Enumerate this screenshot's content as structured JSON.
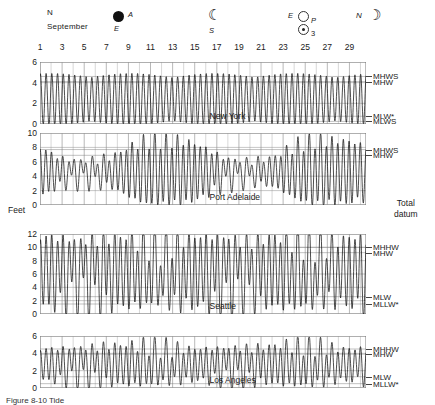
{
  "figure": {
    "caption": "Figure 8-10  Tide",
    "month": "September",
    "y_axis_label": "Feet",
    "right_axis_label_line1": "Total",
    "right_axis_label_line2": "datum"
  },
  "phase_markers": [
    {
      "name": "new-moon-marker",
      "icon": "new-moon-icon",
      "top_label": "N",
      "right_label": "A",
      "bottom_label": "E",
      "x": 47,
      "day": 1
    },
    {
      "name": "first-quarter-marker",
      "icon": "first-quarter-icon",
      "top_label": "",
      "right_label": "",
      "bottom_label": "S",
      "x": 213,
      "day": 16
    },
    {
      "name": "full-moon-marker",
      "icon": "full-moon-icon",
      "top_label": "E",
      "right_label": "P",
      "bottom_label": "",
      "x": 299,
      "day": 23
    },
    {
      "name": "perigee-sun-marker",
      "icon": "sun-icon",
      "top_label": "",
      "right_label": "3",
      "bottom_label": "",
      "x": 299,
      "day": 23
    },
    {
      "name": "last-quarter-marker",
      "icon": "last-quarter-icon",
      "top_label": "N",
      "right_label": "",
      "bottom_label": "",
      "x": 358,
      "day": 28
    }
  ],
  "date_ticks": [
    1,
    3,
    5,
    7,
    9,
    11,
    13,
    15,
    17,
    19,
    21,
    23,
    25,
    27,
    29
  ],
  "chart_data": [
    {
      "type": "line",
      "name": "new-york",
      "title": "New York",
      "xlabel": "September",
      "ylabel": "Feet",
      "ylim": [
        0,
        6
      ],
      "yticks": [
        0,
        2,
        4,
        6
      ],
      "xlim": [
        1,
        30
      ],
      "grid": true,
      "tide_type": "semidiurnal",
      "mean_level": 2.4,
      "amplitude_spring": 2.5,
      "amplitude_neap": 1.7,
      "diurnal_inequality": 0.0,
      "period_hours": 12.42,
      "spring_days": [
        2,
        24
      ],
      "datum_lines": [
        {
          "label": "MHWS",
          "value": 4.6
        },
        {
          "label": "MHW",
          "value": 4.1
        },
        {
          "label": "MLW*",
          "value": 0.75
        },
        {
          "label": "MLWS",
          "value": 0.25
        }
      ]
    },
    {
      "type": "line",
      "name": "port-adelaide",
      "title": "Port Adelaide",
      "xlabel": "September",
      "ylabel": "Feet",
      "ylim": [
        0,
        10
      ],
      "yticks": [
        0,
        2,
        4,
        6,
        8,
        10
      ],
      "xlim": [
        1,
        30
      ],
      "grid": true,
      "tide_type": "mixed-dodge",
      "mean_level": 4.6,
      "amplitude_spring": 3.6,
      "amplitude_neap": 1.1,
      "diurnal_inequality": 1.3,
      "period_hours": 12.42,
      "spring_days": [
        14,
        26
      ],
      "datum_lines": [
        {
          "label": "MHWS",
          "value": 7.7
        },
        {
          "label": "MHW",
          "value": 6.9
        }
      ]
    },
    {
      "type": "line",
      "name": "seattle",
      "title": "Seattle",
      "xlabel": "September",
      "ylabel": "Feet",
      "ylim": [
        0,
        12
      ],
      "yticks": [
        0,
        2,
        4,
        6,
        8,
        10,
        12
      ],
      "xlim": [
        1,
        30
      ],
      "grid": true,
      "tide_type": "mixed-semidiurnal",
      "mean_level": 6.4,
      "amplitude_spring": 5.3,
      "amplitude_neap": 3.0,
      "diurnal_inequality": 3.4,
      "period_hours": 12.42,
      "spring_days": [
        1,
        23
      ],
      "datum_lines": [
        {
          "label": "MHHW",
          "value": 10.0
        },
        {
          "label": "MHW",
          "value": 9.2
        },
        {
          "label": "MLW",
          "value": 2.6
        },
        {
          "label": "MLLW*",
          "value": 1.5
        }
      ]
    },
    {
      "type": "line",
      "name": "los-angeles",
      "title": "Los Angeles",
      "xlabel": "September",
      "ylabel": "Feet",
      "ylim": [
        0,
        6
      ],
      "yticks": [
        0,
        2,
        4,
        6
      ],
      "xlim": [
        1,
        30
      ],
      "grid": true,
      "tide_type": "mixed-semidiurnal",
      "mean_level": 2.7,
      "amplitude_spring": 2.3,
      "amplitude_neap": 1.4,
      "diurnal_inequality": 1.3,
      "period_hours": 12.42,
      "spring_days": [
        9,
        24
      ],
      "datum_lines": [
        {
          "label": "MHHW",
          "value": 4.5
        },
        {
          "label": "MHW",
          "value": 3.9
        },
        {
          "label": "MLW",
          "value": 1.3
        },
        {
          "label": "MLLW*",
          "value": 0.5
        }
      ]
    }
  ]
}
